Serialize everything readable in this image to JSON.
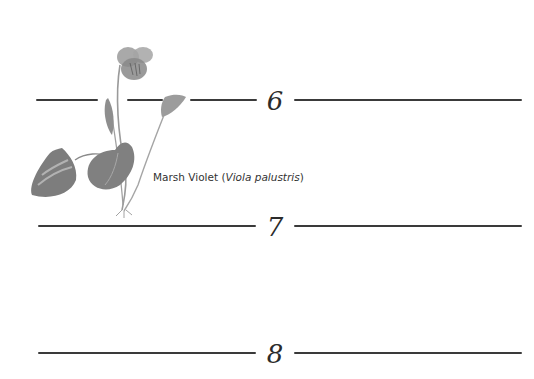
{
  "page": {
    "type": "botanical-journal-page",
    "colors": {
      "background": "#ffffff",
      "ink": "#2b2b2b",
      "rule": "#3a3a3a",
      "leaf": "#7a7a7a",
      "flower": "#8c8c8c"
    }
  },
  "illustration": {
    "subject": "marsh-violet-drawing",
    "caption": {
      "common_name": "Marsh Violet",
      "open_paren": "(",
      "latin_name": "Viola palustris",
      "close_paren": ")"
    }
  },
  "lines": [
    {
      "number": "6"
    },
    {
      "number": "7"
    },
    {
      "number": "8"
    }
  ]
}
